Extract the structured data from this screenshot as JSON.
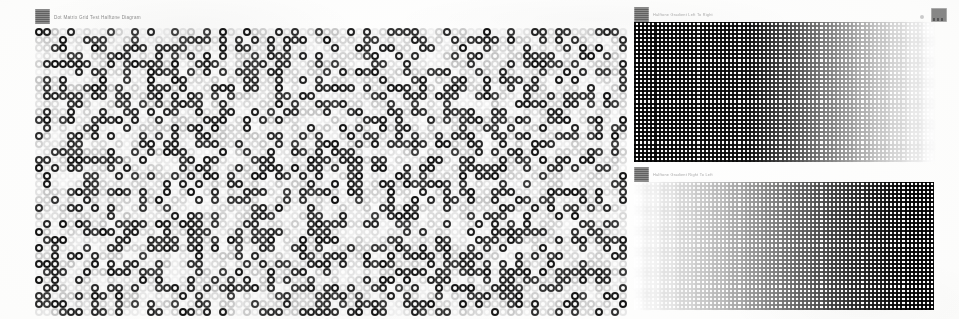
{
  "document": {
    "title": "Dot Matrix Halftone Diagram",
    "background_color": "#fdfdfc"
  },
  "header": {
    "logo_icon": "app-logo-icon",
    "title": "Dot Matrix Grid Test Halftone Diagram",
    "controls": [
      {
        "icon": "more-options-icon",
        "label": ""
      },
      {
        "icon": "grid-view-icon",
        "label": ""
      }
    ]
  },
  "panels": [
    {
      "id": "matrix",
      "icon": "matrix-panel-icon",
      "title": "Dot Matrix Grid Test Halftone Diagram",
      "type": "ring-matrix",
      "columns": 74,
      "rows": 36,
      "cell_size_px": 8,
      "dark_color": "#262626",
      "light_color": "#d8d8d8",
      "fill_ratio": 0.42
    },
    {
      "id": "fine-top",
      "icon": "gradient-panel-icon",
      "title": "Halftone Gradient Left To Right",
      "type": "fine-grid-gradient",
      "cell_size_px": 4,
      "gradient": "dark-to-light",
      "dark_color": "#1a1a1a",
      "light_color": "#ffffff"
    },
    {
      "id": "fine-bottom",
      "icon": "gradient-panel-icon",
      "title": "Halftone Gradient Right To Left",
      "type": "fine-grid-gradient",
      "cell_size_px": 4,
      "gradient": "light-to-dark",
      "dark_color": "#1a1a1a",
      "light_color": "#ffffff"
    }
  ],
  "chart_data": {
    "type": "heatmap",
    "title": "Dot Matrix Grid Test Halftone Diagram",
    "xlabel": "",
    "ylabel": "",
    "grid": true,
    "legend_position": "none",
    "panels": [
      {
        "name": "Ring Matrix",
        "type": "heatmap",
        "glyph": "ring",
        "cols": 74,
        "rows": 36,
        "value_range": [
          0,
          1
        ],
        "note": "Pseudo-random binary pattern: dark rings (value 1) vs light rings (value 0), approx 42% dark."
      },
      {
        "name": "Halftone Gradient Dark To Light",
        "type": "heatmap",
        "glyph": "square-grid",
        "cols": 74,
        "rows": 35,
        "value_range": [
          0,
          1
        ],
        "x": [
          0,
          0.25,
          0.5,
          0.62,
          0.8,
          1.0
        ],
        "values": [
          1.0,
          0.97,
          0.72,
          0.55,
          0.22,
          0.02
        ]
      },
      {
        "name": "Halftone Gradient Light To Dark",
        "type": "heatmap",
        "glyph": "square-grid",
        "cols": 74,
        "rows": 32,
        "value_range": [
          0,
          1
        ],
        "x": [
          0,
          0.2,
          0.4,
          0.6,
          0.8,
          1.0
        ],
        "values": [
          0.02,
          0.18,
          0.4,
          0.66,
          0.88,
          1.0
        ]
      }
    ]
  }
}
